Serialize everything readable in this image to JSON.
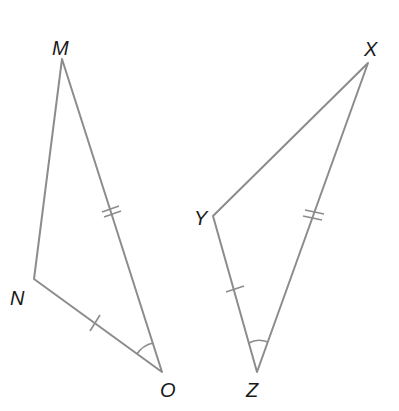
{
  "figure": {
    "type": "congruent-triangles-diagram",
    "line_color": "#8c8c8c",
    "label_color": "#1a1a1a"
  },
  "triangles": [
    {
      "name": "MNO",
      "vertices": [
        {
          "label": "M",
          "x": 62,
          "y": 59,
          "label_x": 52,
          "label_y": 55
        },
        {
          "label": "N",
          "x": 34,
          "y": 279,
          "label_x": 10,
          "label_y": 305
        },
        {
          "label": "O",
          "x": 162,
          "y": 372,
          "label_x": 160,
          "label_y": 397
        }
      ],
      "marks": {
        "double_tick_side": "MO",
        "single_tick_side": "NO",
        "angle_marked": "O"
      }
    },
    {
      "name": "XYZ",
      "vertices": [
        {
          "label": "X",
          "x": 368,
          "y": 63,
          "label_x": 364,
          "label_y": 56
        },
        {
          "label": "Y",
          "x": 213,
          "y": 216,
          "label_x": 194,
          "label_y": 225
        },
        {
          "label": "Z",
          "x": 257,
          "y": 372,
          "label_x": 246,
          "label_y": 397
        }
      ],
      "marks": {
        "double_tick_side": "XZ",
        "single_tick_side": "YZ",
        "angle_marked": "Z"
      }
    }
  ],
  "labels": {
    "M": "M",
    "N": "N",
    "O": "O",
    "X": "X",
    "Y": "Y",
    "Z": "Z"
  }
}
